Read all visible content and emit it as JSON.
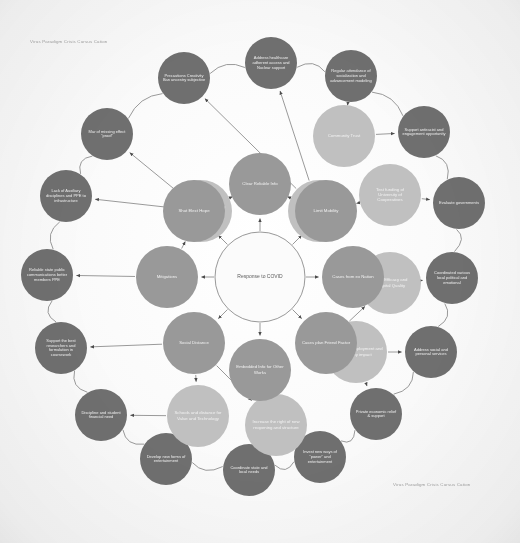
{
  "page": {
    "title": "Response to COVID",
    "caption_top_left": "Virus Paradigm Crisis Cursus Cation",
    "caption_bottom_right": "Virus Paradigm Crisis Cursus Cation"
  },
  "colors": {
    "background": "#fdfdfd",
    "center_fill": "#ffffff",
    "center_stroke": "#8d8d8d",
    "ring_inner_fill": "#9a9a9a",
    "ring_middle_fill": "#c2c2c2",
    "ring_outer_fill": "#6f6f6f",
    "edge_stroke": "#8f8f8f",
    "label_light": "#f2f2f2",
    "label_dark": "#5a5a5a",
    "caption": "#9a9a9a"
  },
  "center": {
    "label": "Response to COVID",
    "cx": 260,
    "cy": 277,
    "r": 45
  },
  "rings": {
    "inner": {
      "radius": 93,
      "node_r": 31,
      "fill": "#9a9a9a",
      "text_color": "#f4f4f4"
    },
    "middle": {
      "radius": 158,
      "node_r": 31,
      "fill": "#c2c2c2",
      "text_color": "#f6f6f6"
    },
    "outer": {
      "radius": 212,
      "node_r": 26,
      "fill": "#6f6f6f",
      "text_color": "#f2f2f2"
    }
  },
  "nodes": {
    "inner": [
      {
        "id": "in-1",
        "label": "Clear Reliable Info",
        "angle": -90,
        "cx": 260,
        "cy": 184
      },
      {
        "id": "in-2",
        "label": "Limit Mobility",
        "angle": -45,
        "cx": 326,
        "cy": 211
      },
      {
        "id": "in-3",
        "label": "Cases from ex Nation",
        "angle": 0,
        "cx": 353,
        "cy": 277
      },
      {
        "id": "in-4",
        "label": "Cases plan Friend Factor",
        "angle": 45,
        "cx": 326,
        "cy": 343
      },
      {
        "id": "in-5",
        "label": "Embedded Info for Other Works",
        "angle": 90,
        "cx": 260,
        "cy": 370
      },
      {
        "id": "in-6",
        "label": "Social Distance",
        "angle": 135,
        "cx": 194,
        "cy": 343
      },
      {
        "id": "in-7",
        "label": "Mitigations",
        "angle": 180,
        "cx": 167,
        "cy": 277
      },
      {
        "id": "in-8",
        "label": "Shut Elect Hope",
        "angle": 225,
        "cx": 194,
        "cy": 211
      }
    ],
    "middle": [
      {
        "id": "mid-1",
        "label": "Community messaging of Information",
        "angle": -112,
        "cx": 201,
        "cy": 211
      },
      {
        "id": "mid-2",
        "label": "Continuous Improve Consistency",
        "angle": -68,
        "cx": 319,
        "cy": 211
      },
      {
        "id": "mid-3",
        "label": "Community Trust",
        "angle": -22,
        "cx": 344,
        "cy": 136
      },
      {
        "id": "mid-4",
        "label": "Test funding of University of Cooperatives",
        "angle": 22,
        "cx": 390,
        "cy": 195
      },
      {
        "id": "mid-5",
        "label": "Clinic Efficacy and Hospital Quality",
        "angle": 68,
        "cx": 390,
        "cy": 283
      },
      {
        "id": "mid-6",
        "label": "Address unemployment and economy impact",
        "angle": 112,
        "cx": 356,
        "cy": 352
      },
      {
        "id": "mid-7",
        "label": "Increase the right of new reopening and structure",
        "angle": 158,
        "cx": 276,
        "cy": 425
      },
      {
        "id": "mid-8",
        "label": "Schools and distance for Value and Technology",
        "angle": 202,
        "cx": 198,
        "cy": 416
      }
    ],
    "outer": [
      {
        "id": "out-1",
        "label": "Precautions Creativity Ban ancestry subjective",
        "angle": -100,
        "cx": 184,
        "cy": 78
      },
      {
        "id": "out-2",
        "label": "Address healthcare adherent access and Nuclear support",
        "angle": -70,
        "cx": 271,
        "cy": 63
      },
      {
        "id": "out-3",
        "label": "Regular attendance of socialization and advancement modeling",
        "angle": -45,
        "cx": 351,
        "cy": 76
      },
      {
        "id": "out-4",
        "label": "Support antiracist and engagement opportunity",
        "angle": -22,
        "cx": 424,
        "cy": 132
      },
      {
        "id": "out-5",
        "label": "Evaluate governments",
        "angle": 0,
        "cx": 459,
        "cy": 203
      },
      {
        "id": "out-6",
        "label": "Coordinated various local political and emotional",
        "angle": 22,
        "cx": 452,
        "cy": 278
      },
      {
        "id": "out-7",
        "label": "Address social and personal services",
        "angle": 45,
        "cx": 431,
        "cy": 352
      },
      {
        "id": "out-8",
        "label": "Private economic relief & support",
        "angle": 68,
        "cx": 376,
        "cy": 414
      },
      {
        "id": "out-9",
        "label": "Invest new ways of \"power\" and entertainment",
        "angle": 90,
        "cx": 320,
        "cy": 457
      },
      {
        "id": "out-10",
        "label": "Coordinate state and local needs",
        "angle": 112,
        "cx": 249,
        "cy": 470
      },
      {
        "id": "out-11",
        "label": "Develop new forms of entertainment",
        "angle": 135,
        "cx": 166,
        "cy": 459
      },
      {
        "id": "out-12",
        "label": "Discipline and student financial need",
        "angle": 158,
        "cx": 101,
        "cy": 415
      },
      {
        "id": "out-13",
        "label": "Support the best researchers and formulation in coursework",
        "angle": 180,
        "cx": 61,
        "cy": 348
      },
      {
        "id": "out-14",
        "label": "Reliable state public communications better members PPE",
        "angle": 202,
        "cx": 47,
        "cy": 275
      },
      {
        "id": "out-15",
        "label": "Lack of Auxiliary disciplines and PPE to infrastructure",
        "angle": 225,
        "cx": 66,
        "cy": 196
      },
      {
        "id": "out-16",
        "label": "Mar of missing effect \"proof\"",
        "angle": 248,
        "cx": 107,
        "cy": 134
      }
    ]
  },
  "edges": [
    {
      "from": "center",
      "to": "in-1"
    },
    {
      "from": "center",
      "to": "in-2"
    },
    {
      "from": "center",
      "to": "in-3"
    },
    {
      "from": "center",
      "to": "in-4"
    },
    {
      "from": "center",
      "to": "in-5"
    },
    {
      "from": "center",
      "to": "in-6"
    },
    {
      "from": "center",
      "to": "in-7"
    },
    {
      "from": "center",
      "to": "in-8"
    },
    {
      "from": "in-1",
      "to": "mid-1"
    },
    {
      "from": "in-1",
      "to": "mid-2"
    },
    {
      "from": "in-2",
      "to": "mid-2"
    },
    {
      "from": "in-2",
      "to": "mid-4"
    },
    {
      "from": "in-3",
      "to": "mid-5"
    },
    {
      "from": "in-4",
      "to": "mid-5"
    },
    {
      "from": "in-4",
      "to": "mid-6"
    },
    {
      "from": "in-5",
      "to": "mid-7"
    },
    {
      "from": "in-6",
      "to": "mid-8"
    },
    {
      "from": "in-7",
      "to": "mid-1"
    },
    {
      "from": "in-8",
      "to": "mid-1"
    },
    {
      "from": "in-6",
      "to": "mid-7"
    },
    {
      "from": "mid-1",
      "to": "out-16"
    },
    {
      "from": "mid-1",
      "to": "out-15"
    },
    {
      "from": "mid-2",
      "to": "out-1"
    },
    {
      "from": "mid-2",
      "to": "out-2"
    },
    {
      "from": "mid-3",
      "to": "out-3"
    },
    {
      "from": "mid-3",
      "to": "out-4"
    },
    {
      "from": "mid-4",
      "to": "out-5"
    },
    {
      "from": "mid-5",
      "to": "out-6"
    },
    {
      "from": "mid-6",
      "to": "out-7"
    },
    {
      "from": "mid-6",
      "to": "out-8"
    },
    {
      "from": "mid-7",
      "to": "out-9"
    },
    {
      "from": "mid-7",
      "to": "out-10"
    },
    {
      "from": "mid-8",
      "to": "out-11"
    },
    {
      "from": "mid-8",
      "to": "out-12"
    },
    {
      "from": "in-7",
      "to": "out-14"
    },
    {
      "from": "in-6",
      "to": "out-13"
    }
  ],
  "perimeter_arcs": [
    {
      "from": "out-1",
      "to": "out-2"
    },
    {
      "from": "out-2",
      "to": "out-3"
    },
    {
      "from": "out-3",
      "to": "out-4"
    },
    {
      "from": "out-4",
      "to": "out-5"
    },
    {
      "from": "out-5",
      "to": "out-6"
    },
    {
      "from": "out-6",
      "to": "out-7"
    },
    {
      "from": "out-7",
      "to": "out-8"
    },
    {
      "from": "out-8",
      "to": "out-9"
    },
    {
      "from": "out-9",
      "to": "out-10"
    },
    {
      "from": "out-10",
      "to": "out-11"
    },
    {
      "from": "out-11",
      "to": "out-12"
    },
    {
      "from": "out-12",
      "to": "out-13"
    },
    {
      "from": "out-13",
      "to": "out-14"
    },
    {
      "from": "out-14",
      "to": "out-15"
    },
    {
      "from": "out-15",
      "to": "out-16"
    },
    {
      "from": "out-16",
      "to": "out-1"
    }
  ]
}
